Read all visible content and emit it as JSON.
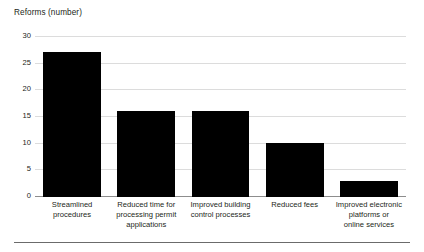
{
  "chart_data": {
    "type": "bar",
    "title": "Reforms (number)",
    "xlabel": "",
    "ylabel": "Reforms (number)",
    "categories": [
      "Streamlined procedures",
      "Reduced time for processing permit applications",
      "Improved building control processes",
      "Reduced fees",
      "Improved electronic platforms or online services"
    ],
    "values": [
      27,
      16,
      16,
      10,
      3
    ],
    "ylim": [
      0,
      30
    ],
    "yticks": [
      0,
      5,
      10,
      15,
      20,
      25,
      30
    ],
    "ytick_labels": [
      "0",
      "5",
      "10",
      "15",
      "20",
      "25",
      "30"
    ],
    "grid": true,
    "legend": false,
    "bar_color": "#000000",
    "gridline_color": "#dcdcdc",
    "axis_color": "#8d8d8d"
  },
  "category_lines": [
    [
      "Streamlined",
      "procedures"
    ],
    [
      "Reduced time for",
      "processing permit",
      "applications"
    ],
    [
      "Improved building",
      "control processes"
    ],
    [
      "Reduced fees"
    ],
    [
      "Improved electronic",
      "platforms or",
      "online services"
    ]
  ]
}
